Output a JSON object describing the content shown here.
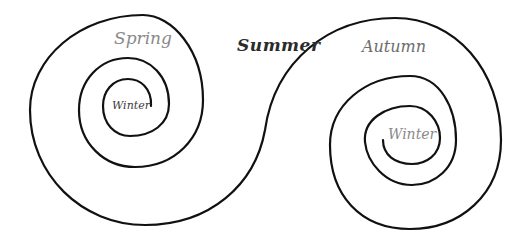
{
  "diagram": {
    "type": "double-spiral",
    "line_color": "#111111",
    "background": "#ffffff",
    "labels": {
      "spring": "Spring",
      "summer": "Summer",
      "autumn": "Autumn",
      "winter_left": "Winter",
      "winter_right": "Winter"
    }
  }
}
